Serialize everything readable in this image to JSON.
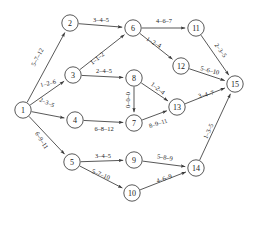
{
  "diagram": {
    "type": "directed-network-graph",
    "title": "",
    "node_radius": 8.2,
    "colors": {
      "background": "#ffffff",
      "stroke": "#3a3a3a",
      "node_fill": "#ffffff",
      "text": "#1a1a1a"
    },
    "nodes": [
      {
        "id": "1",
        "label": "1",
        "x": 23,
        "y": 110
      },
      {
        "id": "2",
        "label": "2",
        "x": 70,
        "y": 23
      },
      {
        "id": "3",
        "label": "3",
        "x": 73,
        "y": 75
      },
      {
        "id": "4",
        "label": "4",
        "x": 75,
        "y": 120
      },
      {
        "id": "5",
        "label": "5",
        "x": 72,
        "y": 162
      },
      {
        "id": "6",
        "label": "6",
        "x": 133,
        "y": 28
      },
      {
        "id": "7",
        "label": "7",
        "x": 134,
        "y": 123
      },
      {
        "id": "8",
        "label": "8",
        "x": 134,
        "y": 78
      },
      {
        "id": "9",
        "label": "9",
        "x": 134,
        "y": 160
      },
      {
        "id": "10",
        "label": "10",
        "x": 132,
        "y": 193
      },
      {
        "id": "11",
        "label": "11",
        "x": 196,
        "y": 28
      },
      {
        "id": "12",
        "label": "12",
        "x": 181,
        "y": 66
      },
      {
        "id": "13",
        "label": "13",
        "x": 177,
        "y": 107
      },
      {
        "id": "14",
        "label": "14",
        "x": 196,
        "y": 168
      },
      {
        "id": "15",
        "label": "15",
        "x": 235,
        "y": 84
      }
    ],
    "edges": [
      {
        "from": "1",
        "to": "2",
        "label": "5–7–12",
        "lx": 37,
        "ly": 57,
        "rot": -62
      },
      {
        "from": "1",
        "to": "3",
        "label": "1–2–6",
        "lx": 48,
        "ly": 83,
        "rot": -14
      },
      {
        "from": "1",
        "to": "4",
        "label": "2–3–5",
        "lx": 47,
        "ly": 102,
        "rot": 24
      },
      {
        "from": "1",
        "to": "5",
        "label": "6–9–11",
        "lx": 42,
        "ly": 140,
        "rot": 58
      },
      {
        "from": "2",
        "to": "6",
        "label": "3–4–5",
        "lx": 101,
        "ly": 19,
        "rot": 0
      },
      {
        "from": "3",
        "to": "6",
        "label": "1–1–2",
        "lx": 97,
        "ly": 58,
        "rot": -39
      },
      {
        "from": "3",
        "to": "8",
        "label": "2–4–5",
        "lx": 104,
        "ly": 70,
        "rot": 0
      },
      {
        "from": "4",
        "to": "7",
        "label": "6–8–12",
        "lx": 104,
        "ly": 128,
        "rot": 0
      },
      {
        "from": "5",
        "to": "9",
        "label": "3–4–5",
        "lx": 103,
        "ly": 155,
        "rot": 0
      },
      {
        "from": "5",
        "to": "10",
        "label": "5–7–10",
        "lx": 101,
        "ly": 174,
        "rot": 22
      },
      {
        "from": "6",
        "to": "11",
        "label": "4–6–7",
        "lx": 164,
        "ly": 20,
        "rot": 0
      },
      {
        "from": "6",
        "to": "12",
        "label": "1–2–4",
        "lx": 154,
        "ly": 42,
        "rot": 29
      },
      {
        "from": "8",
        "to": "7",
        "label": "0–0–0",
        "lx": 127,
        "ly": 100,
        "rot": -90
      },
      {
        "from": "8",
        "to": "13",
        "label": "1–2–4",
        "lx": 158,
        "ly": 88,
        "rot": 38
      },
      {
        "from": "7",
        "to": "13",
        "label": "8–9–11",
        "lx": 158,
        "ly": 123,
        "rot": -18
      },
      {
        "from": "11",
        "to": "15",
        "label": "2–3–5",
        "lx": 221,
        "ly": 50,
        "rot": 54
      },
      {
        "from": "12",
        "to": "15",
        "label": "5–6–10",
        "lx": 210,
        "ly": 70,
        "rot": 14
      },
      {
        "from": "13",
        "to": "15",
        "label": "3–4–7",
        "lx": 206,
        "ly": 94,
        "rot": -14
      },
      {
        "from": "9",
        "to": "14",
        "label": "5–8–9",
        "lx": 165,
        "ly": 157,
        "rot": 9
      },
      {
        "from": "10",
        "to": "14",
        "label": "4–6–9",
        "lx": 164,
        "ly": 178,
        "rot": -19
      },
      {
        "from": "14",
        "to": "15",
        "label": "1–3–5",
        "lx": 208,
        "ly": 131,
        "rot": -66
      }
    ]
  }
}
